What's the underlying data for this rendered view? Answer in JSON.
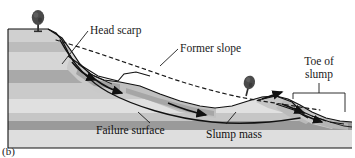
{
  "figure": {
    "caption": "(b)",
    "type": "geologic-cross-section"
  },
  "labels": {
    "head_scarp": "Head scarp",
    "former_slope": "Former slope",
    "toe_of_slump_line1": "Toe of",
    "toe_of_slump_line2": "slump",
    "failure_surface": "Failure surface",
    "slump_mass": "Slump mass"
  },
  "colors": {
    "background": "#ffffff",
    "outline": "#1a1a1a",
    "layer_light": "#d9d9d9",
    "layer_mid": "#c4c4c4",
    "layer_dark": "#a8a8a8",
    "layer_darkest": "#949494",
    "layer_pale": "#e6e6e6",
    "slump_fill": "#bdbdbd",
    "slump_fill_light": "#cfcfcf",
    "tree_foliage": "#4a4a4a",
    "tree_trunk": "#2e2e2e",
    "label_text": "#1a1a1a"
  },
  "elements": {
    "trees": [
      {
        "name": "tree-on-head-scarp",
        "x": 38,
        "y": 30,
        "tilt": 0
      },
      {
        "name": "tree-on-slump-block",
        "x": 246,
        "y": 86,
        "tilt": 14
      }
    ],
    "strata_count": 6,
    "motion_arrows": 6,
    "dashed_former_slope": true,
    "bracket_toe": true
  }
}
